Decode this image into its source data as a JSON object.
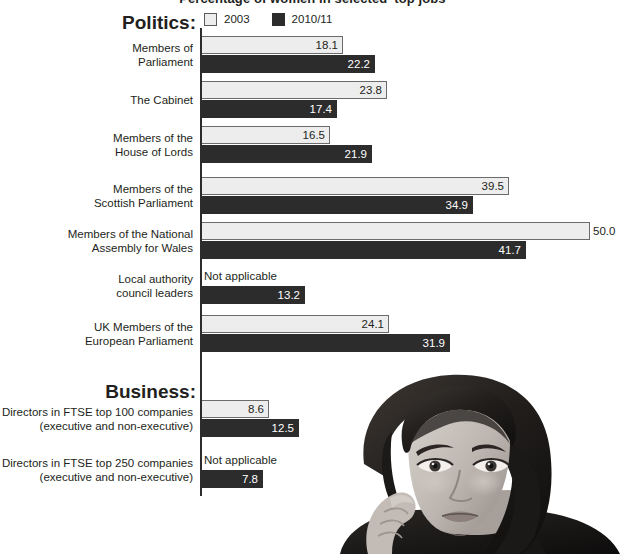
{
  "title": "Percentage of women in selected 'top jobs'",
  "legend": {
    "items": [
      {
        "label": "2003",
        "swatch": "light-square-icon",
        "color": "#ededed"
      },
      {
        "label": "2010/11",
        "swatch": "dark-square-icon",
        "color": "#2c2c2c"
      }
    ]
  },
  "sections": {
    "politics": "Politics:",
    "business": "Business:"
  },
  "colors": {
    "series_2003": "#ededed",
    "series_2010_11": "#2c2c2c",
    "axis": "#2c2c2c",
    "text": "#231f20",
    "background": "#ffffff"
  },
  "na_label": "Not applicable",
  "chart_data": {
    "type": "bar",
    "orientation": "horizontal",
    "title": "Percentage of women in selected 'top jobs'",
    "xlabel": "",
    "ylabel": "",
    "xlim": [
      0,
      50
    ],
    "grid": false,
    "legend_position": "top",
    "categories": [
      "Members of Parliament",
      "The Cabinet",
      "Members of the House of Lords",
      "Members of the Scottish Parliament",
      "Members of the National Assembly for Wales",
      "Local authority council leaders",
      "UK Members of the European Parliament",
      "Directors in FTSE top 100 companies (executive and non-executive)",
      "Directors in FTSE top 250 companies (executive and non-executive)"
    ],
    "series": [
      {
        "name": "2003",
        "values": [
          18.1,
          23.8,
          16.5,
          39.5,
          50.0,
          null,
          24.1,
          8.6,
          null
        ],
        "labels": [
          "18.1",
          "23.8",
          "16.5",
          "39.5",
          "50.0",
          "Not applicable",
          "24.1",
          "8.6",
          "Not applicable"
        ]
      },
      {
        "name": "2010/11",
        "values": [
          22.2,
          17.4,
          21.9,
          34.9,
          41.7,
          13.2,
          31.9,
          12.5,
          7.8
        ],
        "labels": [
          "22.2",
          "17.4",
          "21.9",
          "34.9",
          "41.7",
          "13.2",
          "31.9",
          "12.5",
          "7.8"
        ]
      }
    ]
  },
  "rows": [
    {
      "group": "politics",
      "label_lines": [
        "Members of",
        "Parliament"
      ],
      "top": 36,
      "light": {
        "value": "18.1",
        "width": 141,
        "na": false,
        "outside": false
      },
      "dark": {
        "value": "22.2",
        "width": 173,
        "na": false,
        "outside": false
      }
    },
    {
      "group": "politics",
      "label_lines": [
        "The Cabinet"
      ],
      "top": 81,
      "light": {
        "value": "23.8",
        "width": 185,
        "na": false,
        "outside": false
      },
      "dark": {
        "value": "17.4",
        "width": 135,
        "na": false,
        "outside": false
      }
    },
    {
      "group": "politics",
      "label_lines": [
        "Members of the",
        "House of Lords"
      ],
      "top": 126,
      "light": {
        "value": "16.5",
        "width": 128,
        "na": false,
        "outside": false
      },
      "dark": {
        "value": "21.9",
        "width": 170,
        "na": false,
        "outside": false
      }
    },
    {
      "group": "politics",
      "label_lines": [
        "Members of the",
        "Scottish Parliament"
      ],
      "top": 177,
      "light": {
        "value": "39.5",
        "width": 307,
        "na": false,
        "outside": false
      },
      "dark": {
        "value": "34.9",
        "width": 271,
        "na": false,
        "outside": false
      }
    },
    {
      "group": "politics",
      "label_lines": [
        "Members of the National",
        "Assembly for Wales"
      ],
      "top": 222,
      "light": {
        "value": "50.0",
        "width": 388,
        "na": false,
        "outside": true
      },
      "dark": {
        "value": "41.7",
        "width": 324,
        "na": false,
        "outside": false
      }
    },
    {
      "group": "politics",
      "label_lines": [
        "Local authority",
        "council leaders"
      ],
      "top": 267,
      "light": {
        "value": "Not applicable",
        "width": 0,
        "na": true,
        "outside": false
      },
      "dark": {
        "value": "13.2",
        "width": 103,
        "na": false,
        "outside": false
      }
    },
    {
      "group": "politics",
      "label_lines": [
        "UK Members of the",
        "European Parliament"
      ],
      "top": 315,
      "light": {
        "value": "24.1",
        "width": 187,
        "na": false,
        "outside": false
      },
      "dark": {
        "value": "31.9",
        "width": 248,
        "na": false,
        "outside": false
      }
    },
    {
      "group": "business",
      "label_lines": [
        "Directors in FTSE top 100 companies",
        "(executive and non-executive)"
      ],
      "top": 400,
      "light": {
        "value": "8.6",
        "width": 67,
        "na": false,
        "outside": false
      },
      "dark": {
        "value": "12.5",
        "width": 97,
        "na": false,
        "outside": false
      }
    },
    {
      "group": "business",
      "label_lines": [
        "Directors in FTSE top 250 companies",
        "(executive and non-executive)"
      ],
      "top": 451,
      "light": {
        "value": "Not applicable",
        "width": 0,
        "na": true,
        "outside": false
      },
      "dark": {
        "value": "7.8",
        "width": 61,
        "na": false,
        "outside": false
      }
    }
  ],
  "photo": {
    "name": "portrait-photo-woman",
    "description": "Grayscale photograph of a young woman resting her chin on her hand"
  }
}
